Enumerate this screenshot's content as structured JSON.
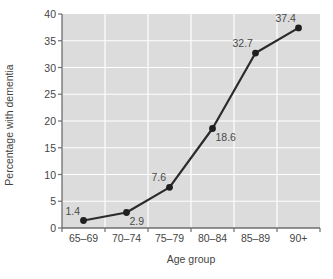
{
  "chart_data": {
    "type": "line",
    "title": "",
    "xlabel": "Age group",
    "ylabel": "Percentage with dementia",
    "categories": [
      "65–69",
      "70–74",
      "75–79",
      "80–84",
      "85–89",
      "90+"
    ],
    "values": [
      1.4,
      2.9,
      7.6,
      18.6,
      32.7,
      37.4
    ],
    "point_labels": [
      "1.4",
      "2.9",
      "7.6",
      "18.6",
      "32.7",
      "37.4"
    ],
    "label_positions": [
      "above-left",
      "below-right",
      "above-left",
      "below-right",
      "above-left",
      "above-left"
    ],
    "ylim": [
      0,
      40
    ],
    "ytick_values": [
      0,
      5,
      10,
      15,
      20,
      25,
      30,
      35,
      40
    ],
    "ytick_labels": [
      "0",
      "5",
      "10",
      "15",
      "20",
      "25",
      "30",
      "35",
      "40"
    ],
    "grid": "white gridlines on gray panel, horizontal and vertical",
    "legend": "none",
    "series_name": "Percentage with dementia",
    "colors": {
      "panel_background": "#dcdcdc",
      "gridline": "#ffffff",
      "line": "#2b2b2b",
      "marker": "#1f1f1f",
      "axis": "#6e6e6e",
      "text": "#454545",
      "page_background": "#ffffff"
    }
  }
}
